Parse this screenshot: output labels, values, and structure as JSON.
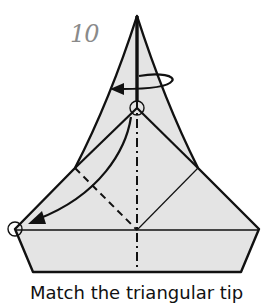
{
  "step": {
    "number": "10"
  },
  "caption": {
    "text": "Match the triangular tip"
  },
  "diagram": {
    "fill_color": "#e4e4e4",
    "line_color": "#111111",
    "step_number_color": "#8a8a8a",
    "symbols": [
      "turn-over-arrow",
      "valley-fold-line",
      "mountain-fold-line",
      "fold-arrow",
      "reference-circle-top",
      "reference-circle-left"
    ]
  }
}
